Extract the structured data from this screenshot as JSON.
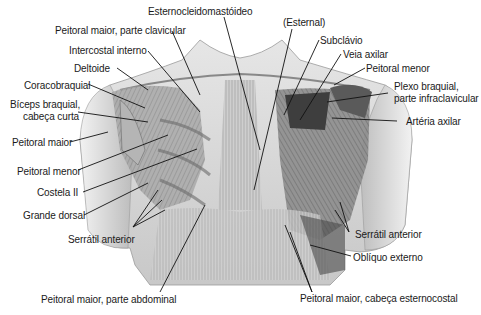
{
  "figure": {
    "labels": {
      "esternocleidomastoideo": "Esternocleidomastóideo",
      "peitoral_maior_clavicular": "Peitoral maior, parte clavicular",
      "intercostal_interno": "Intercostal interno",
      "deltoide": "Deltoide",
      "coracobraquial": "Coracobraquial",
      "biceps_l1": "Bíceps braquial,",
      "biceps_l2": "cabeça curta",
      "peitoral_maior_left": "Peitoral maior",
      "peitoral_menor_left": "Peitoral menor",
      "costela_ii": "Costela II",
      "grande_dorsal": "Grande dorsal",
      "serratil_anterior_left": "Serrátil anterior",
      "peitoral_maior_abdominal": "Peitoral maior, parte abdominal",
      "esternal": "(Esternal)",
      "subclavio": "Subclávio",
      "veia_axilar": "Veia axilar",
      "peitoral_menor_right": "Peitoral menor",
      "plexo_l1": "Plexo braquial,",
      "plexo_l2": "parte infraclavicular",
      "arteria_axilar": "Artéria axilar",
      "serratil_anterior_right": "Serrátil anterior",
      "obliquo_externo": "Oblíquo externo",
      "peitoral_maior_esternocostal": "Peitoral maior, cabeça esternocostal"
    },
    "colors": {
      "background": "#ffffff",
      "text": "#1a1a1a",
      "leader": "#111111",
      "skin_light": "#dcdcdc",
      "muscle_mid": "#9a9a9a",
      "muscle_dark": "#4a4a4a"
    }
  }
}
